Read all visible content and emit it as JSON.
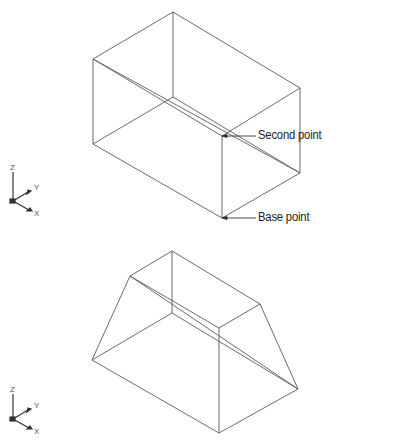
{
  "figure": {
    "top_view": {
      "shape": "box-wireframe",
      "callouts": [
        {
          "label": "Second point",
          "point": [
            222,
            136
          ],
          "text_pos": [
            257,
            125
          ]
        },
        {
          "label": "Base point",
          "point": [
            222,
            218
          ],
          "text_pos": [
            257,
            207
          ]
        }
      ],
      "ucs_icon": {
        "axes": [
          "Z",
          "Y",
          "X"
        ]
      }
    },
    "bottom_view": {
      "shape": "frustum-wireframe",
      "ucs_icon": {
        "axes": [
          "Z",
          "Y",
          "X"
        ]
      }
    },
    "colors": {
      "line": "#555555",
      "text": "#222222",
      "background": "#ffffff"
    }
  }
}
